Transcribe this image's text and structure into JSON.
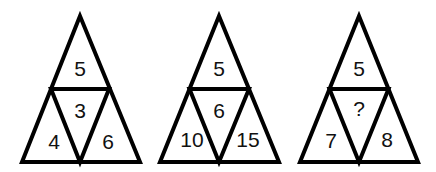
{
  "puzzle": {
    "description": "Three triangles each divided into four sub-triangles with numbers",
    "line_color": "#000000",
    "triangles": [
      {
        "top": "5",
        "center": "3",
        "left": "4",
        "right": "6",
        "apex_x": 80,
        "base_left": 22,
        "base_right": 140
      },
      {
        "top": "5",
        "center": "6",
        "left": "10",
        "right": "15",
        "apex_x": 219,
        "base_left": 160,
        "base_right": 279
      },
      {
        "top": "5",
        "center": "?",
        "left": "7",
        "right": "8",
        "apex_x": 359,
        "base_left": 300,
        "base_right": 418
      }
    ]
  }
}
